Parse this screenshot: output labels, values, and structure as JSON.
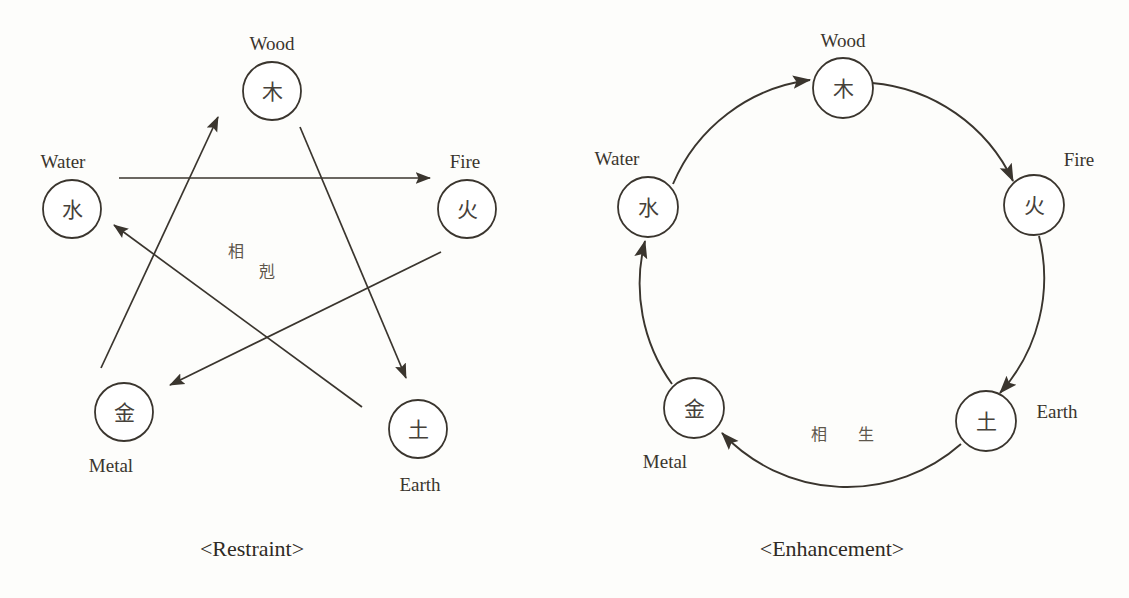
{
  "page": {
    "background_color": "#fdfdfb",
    "ink_color": "#3a352e"
  },
  "diagrams": [
    {
      "id": "restraint",
      "caption": "<Restraint>",
      "center_phrase": "相 剋",
      "center_phrase_chars": [
        "相",
        "剋"
      ],
      "nodes": [
        {
          "key": "wood",
          "glyph": "木",
          "label": "Wood",
          "label_position": "above"
        },
        {
          "key": "fire",
          "glyph": "火",
          "label": "Fire",
          "label_position": "above"
        },
        {
          "key": "earth",
          "glyph": "土",
          "label": "Earth",
          "label_position": "below"
        },
        {
          "key": "metal",
          "glyph": "金",
          "label": "Metal",
          "label_position": "below"
        },
        {
          "key": "water",
          "glyph": "水",
          "label": "Water",
          "label_position": "above"
        }
      ],
      "edges": [
        {
          "from": "water",
          "to": "fire",
          "style": "straight"
        },
        {
          "from": "fire",
          "to": "metal",
          "style": "straight"
        },
        {
          "from": "metal",
          "to": "wood",
          "style": "straight"
        },
        {
          "from": "wood",
          "to": "earth",
          "style": "straight"
        },
        {
          "from": "earth",
          "to": "water",
          "style": "straight"
        }
      ]
    },
    {
      "id": "enhancement",
      "caption": "<Enhancement>",
      "center_phrase": "相 生",
      "center_phrase_chars": [
        "相",
        "生"
      ],
      "nodes": [
        {
          "key": "wood",
          "glyph": "木",
          "label": "Wood",
          "label_position": "above"
        },
        {
          "key": "fire",
          "glyph": "火",
          "label": "Fire",
          "label_position": "above-right"
        },
        {
          "key": "earth",
          "glyph": "土",
          "label": "Earth",
          "label_position": "right"
        },
        {
          "key": "metal",
          "glyph": "金",
          "label": "Metal",
          "label_position": "below-left"
        },
        {
          "key": "water",
          "glyph": "水",
          "label": "Water",
          "label_position": "above-left"
        }
      ],
      "edges": [
        {
          "from": "water",
          "to": "wood",
          "style": "arc"
        },
        {
          "from": "wood",
          "to": "fire",
          "style": "arc"
        },
        {
          "from": "fire",
          "to": "earth",
          "style": "arc"
        },
        {
          "from": "earth",
          "to": "metal",
          "style": "arc"
        },
        {
          "from": "metal",
          "to": "water",
          "style": "arc"
        }
      ]
    }
  ]
}
